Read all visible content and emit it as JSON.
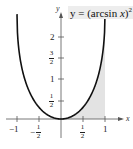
{
  "chart_data": {
    "type": "line",
    "function": "(arcsin x)^2",
    "xlabel": "x",
    "ylabel": "y",
    "xlim": [
      -1.2,
      1.3
    ],
    "ylim": [
      -0.3,
      2.6
    ],
    "grid": false,
    "x_ticks": [
      -1,
      -0.5,
      0.5,
      1
    ],
    "x_tick_labels": [
      "-1",
      "-1/2",
      "1/2",
      "1"
    ],
    "y_ticks": [
      0.5,
      1,
      1.5,
      2
    ],
    "y_tick_labels": [
      "1/2",
      "1",
      "3/2",
      "2"
    ],
    "x": [
      -1,
      -0.9,
      -0.75,
      -0.5,
      -0.25,
      0,
      0.25,
      0.5,
      0.75,
      0.9,
      1
    ],
    "values": [
      2.467,
      1.254,
      0.719,
      0.274,
      0.064,
      0,
      0.064,
      0.274,
      0.719,
      1.254,
      2.467
    ],
    "shaded_region": {
      "description": "area under the curve from x = 0 to x = 1",
      "x_from": 0,
      "x_to": 1,
      "color": "#e3e3e3"
    },
    "colors": {
      "curve": "#111111",
      "axes": "#555555",
      "shade": "#e3e3e3"
    }
  },
  "labels": {
    "title_prefix": "y = (arcsin ",
    "title_var": "x",
    "title_suffix": ")",
    "title_exp": "2",
    "x_axis": "x",
    "y_axis": "y",
    "xt_neg1": "−1",
    "xt_neg_half_num": "1",
    "xt_neg_half_den": "2",
    "xt_neg_sign": "−",
    "xt_half_num": "1",
    "xt_half_den": "2",
    "xt_1": "1",
    "yt_half_num": "1",
    "yt_half_den": "2",
    "yt_1": "1",
    "yt_3half_num": "3",
    "yt_3half_den": "2",
    "yt_2": "2"
  }
}
